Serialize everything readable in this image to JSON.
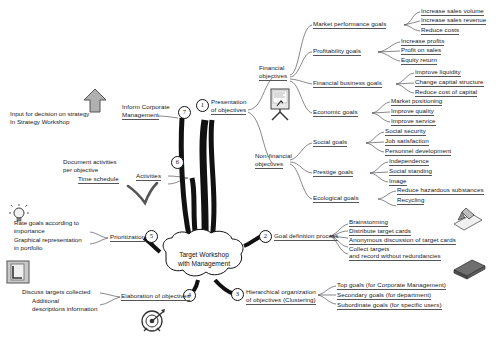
{
  "diagram": {
    "title": "Target Workshop with Management",
    "center": {
      "line1": "Target Workshop",
      "line2": "with Management"
    }
  },
  "branches": [
    {
      "number": "1",
      "label_line1": "Presentation",
      "label_line2": "of objectives",
      "groups": [
        {
          "label_line1": "Financial",
          "label_line2": "objectives",
          "subgroups": [
            {
              "label": "Market performance goals",
              "leaves": [
                "Increase sales volume",
                "Increase sales revenue",
                "Reduce costs"
              ]
            },
            {
              "label": "Profitability goals",
              "leaves": [
                "Increase profits",
                "Profit on sales",
                "Equity return"
              ]
            },
            {
              "label": "Financial business goals",
              "leaves": [
                "Improve liquidity",
                "Change capital structure",
                "Reduce cost of capital"
              ]
            },
            {
              "label": "Economic goals",
              "leaves": [
                "Market positioning",
                "Improve quality",
                "Improve service"
              ]
            }
          ]
        },
        {
          "label_line1": "Non-financial",
          "label_line2": "objectives",
          "subgroups": [
            {
              "label": "Social goals",
              "leaves": [
                "Social security",
                "Job satisfaction",
                "Personnel development"
              ]
            },
            {
              "label": "Prestige goals",
              "leaves": [
                "Independence",
                "Social standing",
                "Image"
              ]
            },
            {
              "label": "Ecological goals",
              "leaves": [
                "Reduce hazardous substances",
                "Recycling"
              ]
            }
          ]
        }
      ]
    },
    {
      "number": "2",
      "label": "Goal definition process",
      "leaves": [
        "Brainstorming",
        "Distribute target cards",
        "Anonymous discussion of target cards",
        "Collect targets",
        "and record without redundancies"
      ]
    },
    {
      "number": "3",
      "label_line1": "Hierarchical organization",
      "label_line2": "of objectives (Clustering)",
      "leaves": [
        "Top goals (for Corporate Management)",
        "Secondary goals (for department)",
        "Subordinate goals (for specific users)"
      ]
    },
    {
      "number": "4",
      "label": "Elaboration of objectives",
      "notes": [
        "Discuss targets collected",
        "Additional",
        "descriptions information"
      ]
    },
    {
      "number": "5",
      "label": "Prioritization",
      "notes": [
        "Rate goals according to",
        "importance",
        "Graphical representation",
        "in portfolio"
      ]
    },
    {
      "number": "6",
      "label": "Activities",
      "notes": [
        "Document activities",
        "per objective",
        "Time schedule"
      ]
    },
    {
      "number": "7",
      "label_line1": "Inform Corporate",
      "label_line2": "Management",
      "notes": [
        "Input for decision on strategy",
        "In Strategy Workshop"
      ]
    }
  ],
  "icons": {
    "flipchart": "flipchart-icon",
    "arrow_up": "arrow-up-icon",
    "checkmark": "checkmark-icon",
    "lightbulb": "lightbulb-icon",
    "document": "document-icon",
    "target": "target-icon",
    "pen_card": "pen-card-icon",
    "card_stack": "card-stack-icon"
  },
  "colors": {
    "line": "#55555a",
    "text": "#17171a",
    "trunk": "#111111",
    "icon_fill": "#9a9a9a"
  }
}
